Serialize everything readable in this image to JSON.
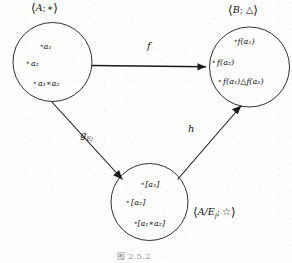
{
  "figure": {
    "kind": "commutative-diagram",
    "caption": "图 2.5.2",
    "ink_color": "#1a1a1a",
    "paper_color": "#fdfdfd"
  },
  "nodes": [
    {
      "id": "domain",
      "label_angle_open": "⟨",
      "label_angle_close": "⟩",
      "label_set": "A",
      "label_sep": ";",
      "label_op": "∗",
      "label_full": "⟨A; ∗⟩",
      "elements": [
        {
          "bullet": "∘",
          "base": "a",
          "sub": "1",
          "text": "a₁"
        },
        {
          "bullet": "∘",
          "base": "a",
          "sub": "2",
          "text": "a₂"
        },
        {
          "bullet": "∘",
          "base": "a",
          "sub": "1",
          "op": "∗",
          "base2": "a",
          "sub2": "2",
          "text": "a₁∗a₂"
        }
      ]
    },
    {
      "id": "codomain",
      "label_angle_open": "⟨",
      "label_angle_close": "⟩",
      "label_set": "B",
      "label_sep": ";",
      "label_op": "△",
      "label_full": "⟨B; △⟩",
      "elements": [
        {
          "bullet": "∘",
          "text": "f(a₁)"
        },
        {
          "bullet": "∘",
          "text": "f(a₂)"
        },
        {
          "bullet": "∘",
          "text": "f(a₁)△f(a₂)"
        }
      ]
    },
    {
      "id": "quotient",
      "label_angle_open": "⟨",
      "label_angle_close": "⟩",
      "label_set": "A/E",
      "label_set_sub": "f",
      "label_sep": ";",
      "label_op": "☆",
      "label_full": "⟨A/E_f; ☆⟩",
      "elements": [
        {
          "bullet": "∘",
          "text": "[a₁]"
        },
        {
          "bullet": "∘",
          "text": "[a₂]"
        },
        {
          "bullet": "∘",
          "text": "[a₁∗a₂]"
        }
      ]
    }
  ],
  "morphisms": [
    {
      "id": "f",
      "label": "f",
      "sub": "",
      "from": "domain",
      "to": "codomain"
    },
    {
      "id": "g",
      "label": "g",
      "sub": "E",
      "sub_sub": "f",
      "from": "domain",
      "to": "quotient"
    },
    {
      "id": "h",
      "label": "h",
      "sub": "",
      "from": "quotient",
      "to": "codomain"
    }
  ]
}
